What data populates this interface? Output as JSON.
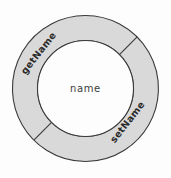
{
  "diagram": {
    "type": "encapsulation-ring",
    "center": {
      "label": "name"
    },
    "ring": {
      "segments": [
        {
          "label": "getName"
        },
        {
          "label": "setName"
        }
      ]
    },
    "colors": {
      "background": "#fdfdfd",
      "ring_fill": "#d9d9d9",
      "inner_fill": "#fdfdfd",
      "stroke": "#3a3a3a",
      "label_text": "#2b2b2b",
      "center_text": "#3c3c3c"
    },
    "geometry": {
      "center_x": 85.5,
      "center_y": 88.5,
      "outer_radius": 73,
      "inner_radius": 48,
      "divider_angles_deg": [
        45,
        225
      ]
    }
  }
}
